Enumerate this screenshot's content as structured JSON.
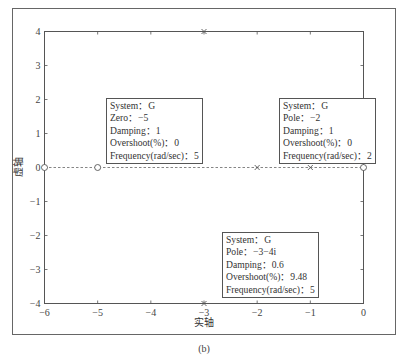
{
  "chart_data": {
    "type": "scatter",
    "title": "",
    "xlabel": "实轴",
    "ylabel": "虚轴",
    "caption": "(b)",
    "xlim": [
      -6,
      0
    ],
    "ylim": [
      -4,
      4
    ],
    "xticks": [
      -6,
      -5,
      -4,
      -3,
      -2,
      -1,
      0
    ],
    "yticks": [
      -4,
      -3,
      -2,
      -1,
      0,
      1,
      2,
      3,
      4
    ],
    "xtick_labels": [
      "−6",
      "−5",
      "−4",
      "−3",
      "−2",
      "−1",
      "0"
    ],
    "ytick_labels": [
      "−4",
      "−3",
      "−2",
      "−1",
      "0",
      "1",
      "2",
      "3",
      "4"
    ],
    "grid": false,
    "reference_line": {
      "y": 0,
      "style": "dashed"
    },
    "series": [
      {
        "name": "zeros",
        "marker": "circle",
        "points": [
          [
            -6,
            0
          ],
          [
            -5,
            0
          ],
          [
            0,
            0
          ]
        ]
      },
      {
        "name": "poles",
        "marker": "x",
        "points": [
          [
            -2,
            0
          ],
          [
            -1,
            0
          ],
          [
            -3,
            4
          ],
          [
            -3,
            -4
          ]
        ]
      }
    ],
    "annotations": [
      {
        "anchor": "top-left",
        "lines": [
          "System：G",
          "Zero：−5",
          "Damping：1",
          "Overshoot(%)：0",
          "Frequency(rad/sec)：5"
        ]
      },
      {
        "anchor": "top-right",
        "lines": [
          "System：G",
          "Pole：−2",
          "Damping：1",
          "Overshoot(%)：0",
          "Frequency(rad/sec)：2"
        ]
      },
      {
        "anchor": "bottom-center",
        "lines": [
          "System：G",
          "Pole：−3−4i",
          "Damping：0.6",
          "Overshoot(%)：9.48",
          "Frequency(rad/sec)：5"
        ]
      }
    ]
  }
}
